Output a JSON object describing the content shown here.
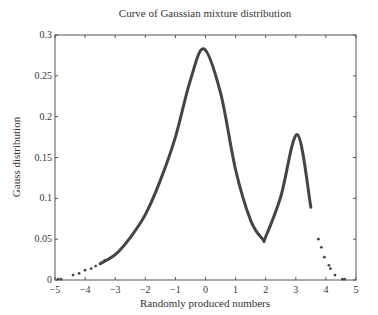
{
  "chart_data": {
    "type": "scatter",
    "title": "Curve of Gaussian mixture distribution",
    "xlabel": "Randomly produced numbers",
    "ylabel": "Gauss distribution",
    "xlim": [
      -5,
      5
    ],
    "ylim": [
      0,
      0.3
    ],
    "xticks": [
      -5,
      -4,
      -3,
      -2,
      -1,
      0,
      1,
      2,
      3,
      4,
      5
    ],
    "yticks": [
      0,
      0.05,
      0.1,
      0.15,
      0.2,
      0.25,
      0.3
    ],
    "ytick_labels": [
      "0",
      "0.05",
      "0.1",
      "0.15",
      "0.2",
      "0.25",
      "0.3"
    ],
    "grid": false,
    "legend": null,
    "marker_color": "#444444",
    "series": [
      {
        "name": "Gaussian mixture density",
        "x": [
          -4.9,
          -4.4,
          -4.0,
          -3.5,
          -3.0,
          -2.5,
          -2.0,
          -1.5,
          -1.0,
          -0.5,
          -0.05,
          0.5,
          1.0,
          1.5,
          1.9,
          2.0,
          2.5,
          3.05,
          3.5,
          4.0,
          4.2,
          4.6
        ],
        "y": [
          0.001,
          0.006,
          0.012,
          0.02,
          0.031,
          0.052,
          0.08,
          0.122,
          0.175,
          0.245,
          0.283,
          0.229,
          0.135,
          0.073,
          0.05,
          0.053,
          0.102,
          0.178,
          0.089,
          0.022,
          0.012,
          0.001
        ]
      }
    ],
    "annotations": [
      {
        "text": "main peak",
        "x": -0.05,
        "y": 0.283
      },
      {
        "text": "secondary peak",
        "x": 3.05,
        "y": 0.178
      },
      {
        "text": "local minimum",
        "x": 1.9,
        "y": 0.05
      }
    ]
  }
}
